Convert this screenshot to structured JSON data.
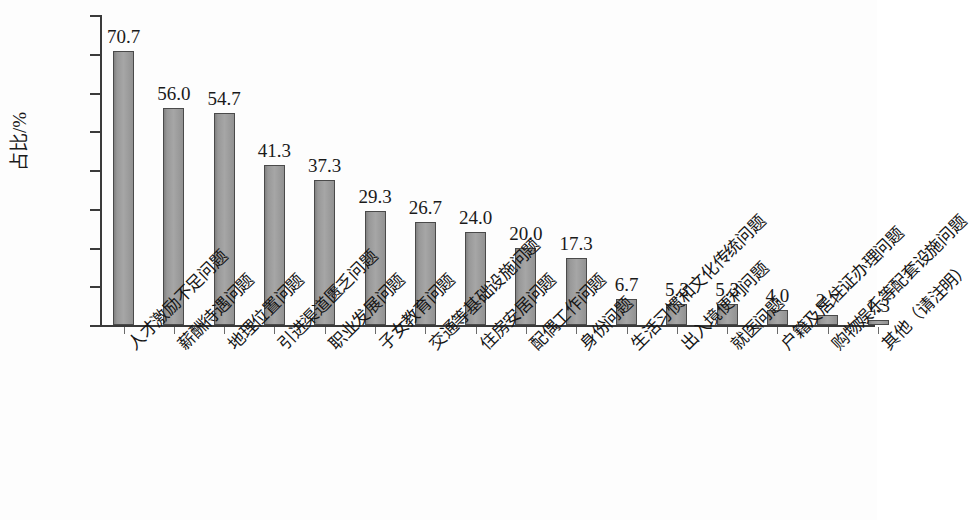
{
  "chart_data": {
    "type": "bar",
    "title": "",
    "subtitle": "",
    "xlabel": "",
    "ylabel": "占比/%",
    "ylim": [
      0,
      80
    ],
    "ytick_labels": [
      "80.0",
      "70.0",
      "60.0",
      "50.0",
      "40.0",
      "30.0",
      "20.0",
      "10.0",
      "0"
    ],
    "ytick_values": [
      80,
      70,
      60,
      50,
      40,
      30,
      20,
      10,
      0
    ],
    "grid": false,
    "legend": null,
    "bar_color": "#9c9c9c",
    "bar_edge_color": "#4a4a4a",
    "axis_color": "#3a3a3a",
    "categories": [
      "人才激励不足问题",
      "薪酬待遇问题",
      "地理位置问题",
      "引进渠道匮乏问题",
      "职业发展问题",
      "子女教育问题",
      "交通等基础设施问题",
      "住房安居问题",
      "配偶工作问题",
      "身份问题",
      "生活习惯和文化传统问题",
      "出入境便利问题",
      "就医问题",
      "户籍及居住证办理问题",
      "购物娱乐等配套设施问题",
      "其他（请注明）"
    ],
    "values": [
      70.7,
      56.0,
      54.7,
      41.3,
      37.3,
      29.3,
      26.7,
      24.0,
      20.0,
      17.3,
      6.7,
      5.3,
      5.3,
      4.0,
      2.7,
      1.3
    ],
    "value_labels": [
      "70.7",
      "56.0",
      "54.7",
      "41.3",
      "37.3",
      "29.3",
      "26.7",
      "24.0",
      "20.0",
      "17.3",
      "6.7",
      "5.3",
      "5.3",
      "4.0",
      "2.7",
      "1.3"
    ]
  }
}
